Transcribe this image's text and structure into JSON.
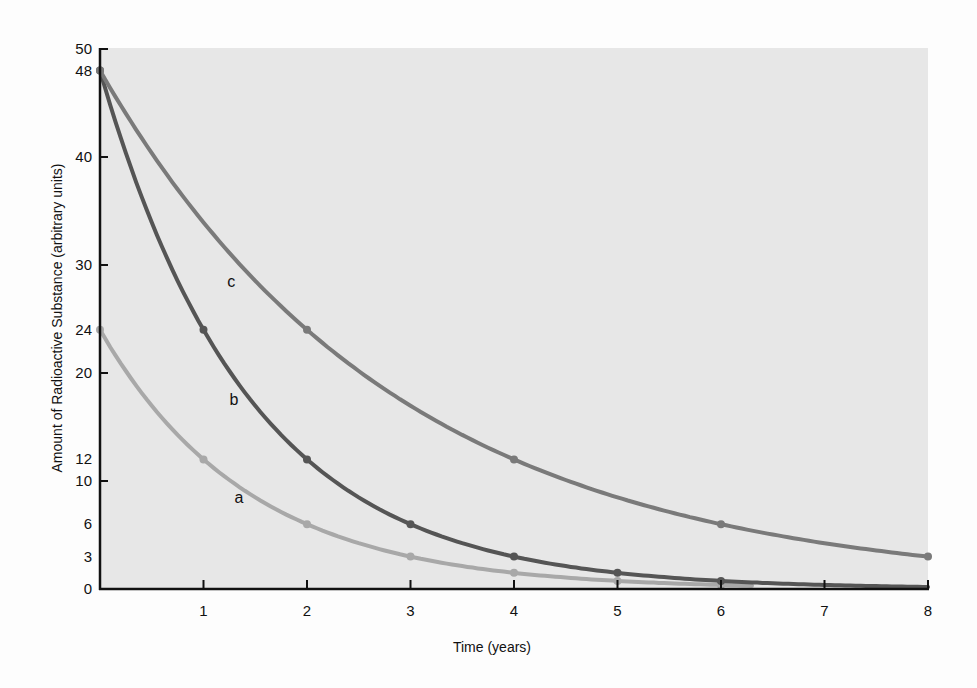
{
  "chart_data": {
    "type": "line",
    "title": "",
    "xlabel": "Time (years)",
    "ylabel": "Amount of Radioactive Substance (arbitrary units)",
    "xlim": [
      0,
      8
    ],
    "ylim": [
      0,
      50
    ],
    "x_ticks": [
      1,
      2,
      3,
      4,
      5,
      6,
      7,
      8
    ],
    "y_ticks": [
      0,
      3,
      6,
      10,
      12,
      20,
      24,
      30,
      40,
      48,
      50
    ],
    "y_tick_marks": [
      10,
      20,
      30,
      40,
      50
    ],
    "grid": false,
    "legend": "inline labels",
    "series": [
      {
        "name": "a",
        "color": "#a8a8a8",
        "x": [
          0,
          1,
          2,
          3,
          4,
          5,
          6
        ],
        "values": [
          24,
          12,
          6,
          3,
          1.5,
          0.75,
          0.375
        ],
        "end_x": 6.3,
        "label_pos": [
          1.3,
          8
        ]
      },
      {
        "name": "b",
        "color": "#555555",
        "x": [
          0,
          1,
          2,
          3,
          4,
          5,
          6
        ],
        "values": [
          48,
          24,
          12,
          6,
          3,
          1.5,
          0.75
        ],
        "end_x": 8,
        "label_pos": [
          1.25,
          17
        ]
      },
      {
        "name": "c",
        "color": "#7a7a7a",
        "x": [
          0,
          2,
          4,
          6,
          8
        ],
        "values": [
          48,
          24,
          12,
          6,
          3
        ],
        "end_x": 8,
        "label_pos": [
          1.23,
          28
        ]
      }
    ]
  },
  "colors": {
    "plot_bg": "#e7e7e7",
    "page_bg": "#fdfdfd",
    "axis": "#111111"
  }
}
